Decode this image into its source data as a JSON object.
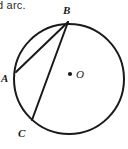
{
  "figure": {
    "caption_fragment": "d arc.",
    "shape": "circle-with-two-chords",
    "stroke_color": "#1a1a1a",
    "fill_color": "#ffffff",
    "circle": {
      "center_label": "O",
      "center_x": 69,
      "center_y": 79,
      "radius": 55,
      "stroke_width": 2.0
    },
    "center_dot": {
      "label": "center-point",
      "x": 70,
      "y": 74,
      "r": 2.0
    },
    "points": [
      {
        "label": "A",
        "x": 16,
        "y": 72,
        "label_x": 1,
        "label_y": 82
      },
      {
        "label": "B",
        "x": 68,
        "y": 22,
        "label_x": 63,
        "label_y": 14
      },
      {
        "label": "C",
        "x": 32,
        "y": 120,
        "label_x": 18,
        "label_y": 136
      }
    ],
    "chords": [
      {
        "name": "chord-BA",
        "from": "B",
        "to": "A",
        "x1": 68,
        "y1": 22,
        "x2": 16,
        "y2": 72,
        "stroke_width": 2.0
      },
      {
        "name": "chord-BC",
        "from": "B",
        "to": "C",
        "x1": 68,
        "y1": 22,
        "x2": 32,
        "y2": 120,
        "stroke_width": 2.0
      }
    ]
  }
}
